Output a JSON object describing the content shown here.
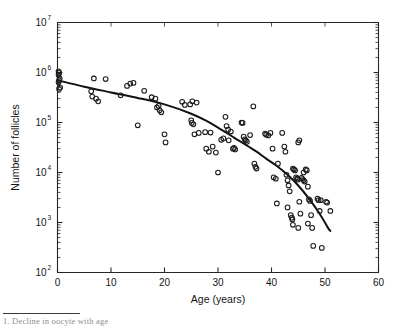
{
  "figure": {
    "background_color": "#ffffff",
    "marker_color": "#1c1c1c",
    "curve_color": "#121212",
    "axis_color": "#262626",
    "caption_partial": "1.  Decline in oocyte with age"
  },
  "chart_data": {
    "type": "scatter",
    "title": "",
    "xlabel": "Age (years)",
    "ylabel": "Number of follicles",
    "xlim": [
      0,
      60
    ],
    "ylim": [
      100,
      10000000
    ],
    "yscale": "log",
    "xscale": "linear",
    "grid": false,
    "legend": null,
    "xticks": [
      0,
      10,
      20,
      30,
      40,
      50,
      60
    ],
    "xticklabels": [
      "0",
      "10",
      "20",
      "30",
      "40",
      "50",
      "60"
    ],
    "yticks": [
      100,
      1000,
      10000,
      100000,
      1000000,
      10000000
    ],
    "yticklabels": [
      "10^2",
      "10^3",
      "10^4",
      "10^5",
      "10^6",
      "10^7"
    ],
    "ytick_bases": [
      "10",
      "10",
      "10",
      "10",
      "10",
      "10"
    ],
    "ytick_exponents": [
      "2",
      "3",
      "4",
      "5",
      "6",
      "7"
    ],
    "minor_ticks": "log decades",
    "marker_style": "open circle",
    "series": [
      {
        "name": "Follicle counts",
        "type": "scatter",
        "points": [
          [
            0.2,
            1050000
          ],
          [
            0.3,
            980000
          ],
          [
            0.2,
            900000
          ],
          [
            0.4,
            760000
          ],
          [
            0.3,
            700000
          ],
          [
            0.2,
            640000
          ],
          [
            0.5,
            500000
          ],
          [
            0.3,
            470000
          ],
          [
            6.3,
            420000
          ],
          [
            6.5,
            330000
          ],
          [
            6.8,
            760000
          ],
          [
            7.2,
            300000
          ],
          [
            7.6,
            265000
          ],
          [
            9.0,
            740000
          ],
          [
            11.8,
            350000
          ],
          [
            13.0,
            540000
          ],
          [
            13.6,
            600000
          ],
          [
            14.2,
            620000
          ],
          [
            15.0,
            88000
          ],
          [
            16.2,
            430000
          ],
          [
            17.6,
            320000
          ],
          [
            18.3,
            300000
          ],
          [
            18.6,
            200000
          ],
          [
            18.9,
            215000
          ],
          [
            19.1,
            175000
          ],
          [
            19.4,
            160000
          ],
          [
            20.0,
            58000
          ],
          [
            20.2,
            40000
          ],
          [
            23.3,
            260000
          ],
          [
            23.8,
            225000
          ],
          [
            24.8,
            230000
          ],
          [
            25.2,
            265000
          ],
          [
            25.0,
            110000
          ],
          [
            25.1,
            98000
          ],
          [
            25.4,
            92000
          ],
          [
            25.6,
            58000
          ],
          [
            26.0,
            250000
          ],
          [
            26.4,
            62000
          ],
          [
            27.6,
            64000
          ],
          [
            27.8,
            30000
          ],
          [
            28.3,
            26000
          ],
          [
            28.6,
            63000
          ],
          [
            29.0,
            33000
          ],
          [
            30.0,
            10000
          ],
          [
            30.6,
            45000
          ],
          [
            31.0,
            48000
          ],
          [
            31.4,
            130000
          ],
          [
            31.6,
            85000
          ],
          [
            31.9,
            72000
          ],
          [
            32.0,
            44000
          ],
          [
            32.4,
            66000
          ],
          [
            32.8,
            30000
          ],
          [
            33.0,
            31000
          ],
          [
            33.2,
            29000
          ],
          [
            34.4,
            100000
          ],
          [
            34.6,
            98000
          ],
          [
            34.8,
            52000
          ],
          [
            35.0,
            46000
          ],
          [
            35.2,
            44000
          ],
          [
            35.4,
            41000
          ],
          [
            36.0,
            56000
          ],
          [
            36.6,
            210000
          ],
          [
            37.2,
            12000
          ],
          [
            38.8,
            60000
          ],
          [
            39.0,
            57000
          ],
          [
            39.4,
            55000
          ],
          [
            39.8,
            62000
          ],
          [
            40.2,
            30000
          ],
          [
            40.4,
            8000
          ],
          [
            40.8,
            7500
          ],
          [
            41.0,
            2400
          ],
          [
            41.2,
            15000
          ],
          [
            42.0,
            62000
          ],
          [
            42.4,
            33000
          ],
          [
            42.6,
            26000
          ],
          [
            42.8,
            9000
          ],
          [
            43.0,
            7000
          ],
          [
            43.2,
            5500
          ],
          [
            43.4,
            4200
          ],
          [
            43.6,
            1400
          ],
          [
            43.8,
            1250
          ],
          [
            43.9,
            1150
          ],
          [
            44.0,
            12000
          ],
          [
            44.2,
            11500
          ],
          [
            44.4,
            11000
          ],
          [
            44.6,
            8000
          ],
          [
            44.8,
            7600
          ],
          [
            44.9,
            7200
          ],
          [
            45.0,
            780
          ],
          [
            45.2,
            2600
          ],
          [
            45.4,
            1500
          ],
          [
            45.6,
            7800
          ],
          [
            45.8,
            7400
          ],
          [
            46.0,
            7000
          ],
          [
            46.2,
            6600
          ],
          [
            46.4,
            11500
          ],
          [
            46.6,
            11000
          ],
          [
            46.8,
            5200
          ],
          [
            47.0,
            2900
          ],
          [
            47.2,
            2700
          ],
          [
            47.4,
            1400
          ],
          [
            47.6,
            780
          ],
          [
            47.8,
            340
          ],
          [
            45.0,
            40000
          ],
          [
            45.2,
            44000
          ],
          [
            46.0,
            10000
          ],
          [
            48.6,
            3000
          ],
          [
            48.8,
            2800
          ],
          [
            49.0,
            1700
          ],
          [
            49.2,
            2800
          ],
          [
            49.4,
            310
          ],
          [
            50.2,
            2600
          ],
          [
            50.4,
            2500
          ],
          [
            51.0,
            1700
          ],
          [
            36.8,
            15000
          ],
          [
            29.6,
            25000
          ],
          [
            37.0,
            13000
          ],
          [
            43.0,
            2000
          ],
          [
            44.0,
            900
          ],
          [
            46.8,
            950
          ]
        ]
      },
      {
        "name": "Fitted decline curve",
        "type": "line",
        "points": [
          [
            0.0,
            700000
          ],
          [
            5.0,
            520000
          ],
          [
            10.0,
            400000
          ],
          [
            15.0,
            310000
          ],
          [
            20.0,
            230000
          ],
          [
            25.0,
            150000
          ],
          [
            28.0,
            105000
          ],
          [
            31.0,
            68000
          ],
          [
            33.0,
            50000
          ],
          [
            35.0,
            37000
          ],
          [
            37.0,
            27000
          ],
          [
            39.0,
            19000
          ],
          [
            41.0,
            13500
          ],
          [
            43.0,
            9000
          ],
          [
            45.0,
            5500
          ],
          [
            47.0,
            3000
          ],
          [
            49.0,
            1500
          ],
          [
            50.5,
            800
          ],
          [
            51.0,
            680
          ]
        ]
      }
    ]
  }
}
